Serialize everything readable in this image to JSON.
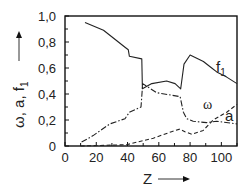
{
  "chart_data": {
    "type": "line",
    "title": "",
    "xlabel": "Z",
    "ylabel": "ω, a, f1",
    "xlim": [
      0,
      110
    ],
    "ylim": [
      0,
      1.0
    ],
    "grid": false,
    "legend": "inline labels",
    "x_ticks": [
      0,
      20,
      40,
      60,
      80,
      100
    ],
    "x_tick_labels": [
      "0",
      "20",
      "40",
      "60",
      "80",
      "100"
    ],
    "y_ticks": [
      0,
      0.2,
      0.4,
      0.6,
      0.8,
      1.0
    ],
    "y_tick_labels": [
      "0",
      "0,2",
      "0,4",
      "0,6",
      "0,8",
      "1,0"
    ],
    "series": [
      {
        "name": "f1",
        "style": "solid",
        "label_pos": [
          97,
          0.6
        ],
        "x": [
          12.8,
          24.6,
          33.1,
          38.4,
          40.5,
          41.2,
          49.1,
          49.5,
          55.5,
          65,
          70.4,
          74,
          76.1,
          80,
          88.5,
          93.8,
          97,
          103.4,
          110
        ],
        "values": [
          0.95,
          0.89,
          0.81,
          0.76,
          0.74,
          0.69,
          0.67,
          0.44,
          0.48,
          0.5,
          0.48,
          0.44,
          0.63,
          0.7,
          0.65,
          0.6,
          0.57,
          0.53,
          0.48
        ]
      },
      {
        "name": "ω",
        "style": "dashdot",
        "label_pos": [
          89,
          0.28
        ],
        "x": [
          10.6,
          18,
          28.7,
          38.4,
          41.2,
          48.6,
          49.7,
          58.6,
          73.6,
          75.7,
          77.8,
          82,
          90.5,
          97,
          110
        ],
        "values": [
          0.03,
          0.08,
          0.17,
          0.21,
          0.26,
          0.3,
          0.48,
          0.41,
          0.38,
          0.26,
          0.21,
          0.19,
          0.18,
          0.19,
          0.17
        ]
      },
      {
        "name": "a",
        "style": "dashed",
        "label_pos": [
          104,
          0.19
        ],
        "x": [
          10,
          39.4,
          56.5,
          68.1,
          73.5,
          76.7,
          81,
          88.4,
          94.8,
          103.4,
          110
        ],
        "values": [
          0.0,
          0.01,
          0.06,
          0.11,
          0.13,
          0.11,
          0.09,
          0.12,
          0.2,
          0.26,
          0.32
        ]
      }
    ]
  },
  "labels": {
    "x_axis": "Z",
    "y_axis": "ω, a, f",
    "y_axis_sub": "1",
    "f1": "f",
    "f1_sub": "1",
    "omega": "ω",
    "a": "a"
  }
}
